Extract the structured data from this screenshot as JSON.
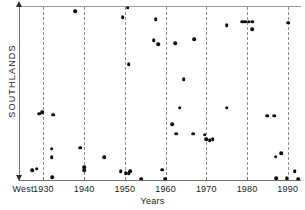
{
  "chart_data": {
    "type": "scatter",
    "title": "",
    "xlabel": "Years",
    "ylabel": "SOUTHLANDS",
    "xlim": [
      1924,
      1993
    ],
    "ylim": [
      0,
      100
    ],
    "grid": true,
    "grid_axis": "x",
    "legend": "none",
    "xtick_labels": [
      "West",
      "1930",
      "1940",
      "1950",
      "1960",
      "1970",
      "1980",
      "1990"
    ],
    "xtick_values": [
      1925,
      1930,
      1940,
      1950,
      1960,
      1970,
      1980,
      1990
    ],
    "gridline_values": [
      1930,
      1940,
      1950,
      1960,
      1970,
      1980,
      1990
    ],
    "y_axis_arrows": "both",
    "y_tick_labels": [],
    "points": [
      {
        "x": 1937.8,
        "y": 97.0
      },
      {
        "x": 1950.7,
        "y": 99.0
      },
      {
        "x": 1949.5,
        "y": 93.5
      },
      {
        "x": 1957.6,
        "y": 92.5
      },
      {
        "x": 1975.0,
        "y": 89.0
      },
      {
        "x": 1978.8,
        "y": 91.0
      },
      {
        "x": 1979.6,
        "y": 91.0
      },
      {
        "x": 1980.4,
        "y": 91.0
      },
      {
        "x": 1981.3,
        "y": 91.0
      },
      {
        "x": 1981.3,
        "y": 86.5
      },
      {
        "x": 1990.1,
        "y": 90.5
      },
      {
        "x": 1957.1,
        "y": 80.5
      },
      {
        "x": 1958.2,
        "y": 78.0
      },
      {
        "x": 1962.3,
        "y": 78.5
      },
      {
        "x": 1967.0,
        "y": 81.0
      },
      {
        "x": 1950.9,
        "y": 66.5
      },
      {
        "x": 1964.4,
        "y": 58.0
      },
      {
        "x": 1963.5,
        "y": 41.5
      },
      {
        "x": 1975.0,
        "y": 41.5
      },
      {
        "x": 1928.9,
        "y": 38.0
      },
      {
        "x": 1929.7,
        "y": 39.0
      },
      {
        "x": 1932.4,
        "y": 37.5
      },
      {
        "x": 1985.0,
        "y": 37.0
      },
      {
        "x": 1986.6,
        "y": 37.0
      },
      {
        "x": 1961.6,
        "y": 32.0
      },
      {
        "x": 1962.6,
        "y": 26.5
      },
      {
        "x": 1966.8,
        "y": 26.5
      },
      {
        "x": 1969.6,
        "y": 26.0
      },
      {
        "x": 1970.0,
        "y": 23.5
      },
      {
        "x": 1970.8,
        "y": 23.0
      },
      {
        "x": 1971.6,
        "y": 23.5
      },
      {
        "x": 1932.0,
        "y": 18.0
      },
      {
        "x": 1932.0,
        "y": 13.0
      },
      {
        "x": 1939.0,
        "y": 18.5
      },
      {
        "x": 1944.9,
        "y": 13.0
      },
      {
        "x": 1987.0,
        "y": 13.5
      },
      {
        "x": 1988.4,
        "y": 15.5
      },
      {
        "x": 1940.0,
        "y": 7.5
      },
      {
        "x": 1940.0,
        "y": 5.5
      },
      {
        "x": 1927.2,
        "y": 5.5
      },
      {
        "x": 1928.3,
        "y": 6.5
      },
      {
        "x": 1959.2,
        "y": 6.0
      },
      {
        "x": 1949.0,
        "y": 5.0
      },
      {
        "x": 1950.2,
        "y": 4.0
      },
      {
        "x": 1950.9,
        "y": 4.0
      },
      {
        "x": 1951.3,
        "y": 5.0
      },
      {
        "x": 1991.7,
        "y": 5.0
      },
      {
        "x": 1932.1,
        "y": 1.5
      },
      {
        "x": 1954.0,
        "y": 0.8
      },
      {
        "x": 1959.9,
        "y": 0.8
      },
      {
        "x": 1987.2,
        "y": 1.0
      },
      {
        "x": 1989.7,
        "y": 1.0
      },
      {
        "x": 1992.6,
        "y": 0.8
      }
    ]
  },
  "colors": {
    "point": "#0d0d0d",
    "axis": "#6f6f6f",
    "grid": "#8d8d8d",
    "text": "#1a1a1a",
    "background": "#ffffff"
  }
}
